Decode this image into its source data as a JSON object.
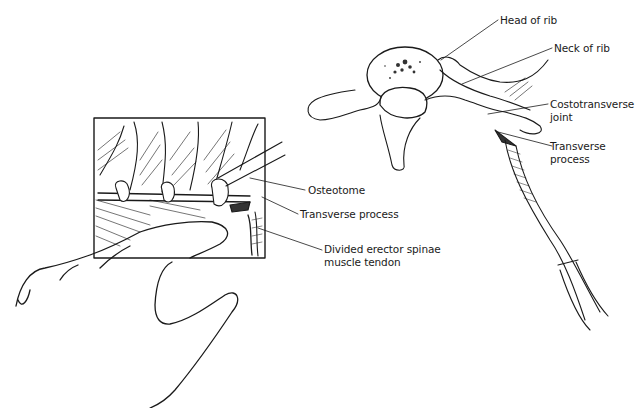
{
  "figure": {
    "left_panel": {
      "description": "Operative field inset with hand retracting tissue and osteotome on transverse process",
      "labels": {
        "osteotome": "Osteotome",
        "transverse_process": "Transverse process",
        "divided_erector_1": "Divided erector spinae",
        "divided_erector_2": "muscle tendon"
      }
    },
    "right_panel": {
      "description": "Thoracic vertebra with rib, costotransverse joint divided by knife",
      "labels": {
        "head_of_rib": "Head of rib",
        "neck_of_rib": "Neck of rib",
        "costotransverse_1": "Costotransverse",
        "costotransverse_2": "joint",
        "transverse_1": "Transverse",
        "transverse_2": "process"
      }
    },
    "colors": {
      "line": "#1a1a1a",
      "background": "#ffffff",
      "shade": "#555555"
    }
  }
}
